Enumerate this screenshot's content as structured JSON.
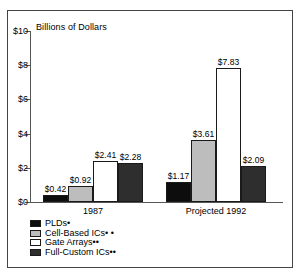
{
  "chart_data": {
    "type": "bar",
    "title": "",
    "subtitle": "",
    "xlabel": "",
    "ylabel": "Billions of Dollars",
    "categories": [
      "1987",
      "Projected 1992"
    ],
    "series": [
      {
        "name": "PLDs",
        "footnote": "*",
        "color": "#0d0d0d",
        "values": [
          0.42,
          1.17
        ],
        "labels": [
          "$0.42",
          "$1.17"
        ]
      },
      {
        "name": "Cell-Based ICs",
        "footnote": "**",
        "color": "#bdbdbd",
        "values": [
          0.92,
          3.61
        ],
        "labels": [
          "$0.92",
          "$3.61"
        ]
      },
      {
        "name": "Gate Arrays",
        "footnote": "**",
        "color": "#ffffff",
        "values": [
          2.41,
          7.83
        ],
        "labels": [
          "$2.41",
          "$7.83"
        ]
      },
      {
        "name": "Full-Custom ICs",
        "footnote": "**",
        "color": "#2e2e2e",
        "values": [
          2.28,
          2.09
        ],
        "labels": [
          "$2.28",
          "$2.09"
        ]
      }
    ],
    "ylim": [
      0,
      10
    ],
    "yticks": [
      0,
      2,
      4,
      6,
      8,
      10
    ],
    "ytick_labels": [
      "$0",
      "$2",
      "$4",
      "$6",
      "$8",
      "$10"
    ],
    "grid": false,
    "legend_position": "below-left"
  },
  "legend": {
    "items": [
      {
        "label": "PLDs",
        "mark": "•"
      },
      {
        "label": "Cell-Based ICs",
        "mark": "• •"
      },
      {
        "label": "Gate Arrays",
        "mark": "••"
      },
      {
        "label": "Full-Custom ICs",
        "mark": "••"
      }
    ]
  }
}
